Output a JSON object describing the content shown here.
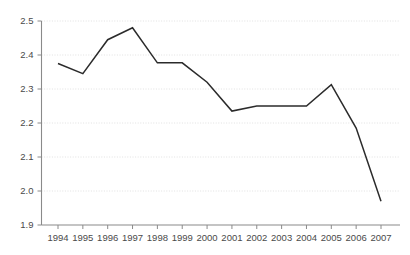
{
  "chart_data": {
    "type": "line",
    "title": "",
    "subtitle": "",
    "xlabel": "",
    "ylabel": "",
    "categories": [
      "1994",
      "1995",
      "1996",
      "1997",
      "1998",
      "1999",
      "2000",
      "2001",
      "2002",
      "2003",
      "2004",
      "2005",
      "2006",
      "2007"
    ],
    "x": [
      1994,
      1995,
      1996,
      1997,
      1998,
      1999,
      2000,
      2001,
      2002,
      2003,
      2004,
      2005,
      2006,
      2007
    ],
    "values": [
      2.375,
      2.345,
      2.445,
      2.48,
      2.377,
      2.377,
      2.32,
      2.235,
      2.25,
      2.25,
      2.25,
      2.313,
      2.185,
      1.97
    ],
    "series": [
      {
        "name": "",
        "values": [
          2.375,
          2.345,
          2.445,
          2.48,
          2.377,
          2.377,
          2.32,
          2.235,
          2.25,
          2.25,
          2.25,
          2.313,
          2.185,
          1.97
        ],
        "color": "#2b2b2b"
      }
    ],
    "ylim": [
      1.9,
      2.5
    ],
    "yticks": [
      1.9,
      2.0,
      2.1,
      2.2,
      2.3,
      2.4,
      2.5
    ],
    "ytick_labels": [
      "1.9",
      "2.0",
      "2.1",
      "2.2",
      "2.3",
      "2.4",
      "2.5"
    ],
    "xtick_labels": [
      "1994",
      "1995",
      "1996",
      "1997",
      "1998",
      "1999",
      "2000",
      "2001",
      "2002",
      "2003",
      "2004",
      "2005",
      "2006",
      "2007"
    ],
    "grid": true,
    "grid_axis": "y",
    "legend": false,
    "legend_position": "none",
    "annotations": [],
    "colors": {
      "line": "#2b2b2b",
      "grid": "#d9d9d9",
      "axis": "#8a8a8a",
      "text": "#4a4a4a",
      "background": "#ffffff"
    }
  }
}
